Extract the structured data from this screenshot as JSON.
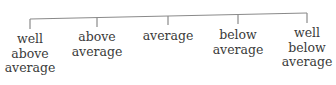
{
  "diagram": {
    "type": "rating-scale",
    "line_color": "#8a8a8a",
    "categories": [
      {
        "label": "well above average",
        "lines": [
          "well",
          "above",
          "average"
        ],
        "x": 30,
        "top": 24
      },
      {
        "label": "above average",
        "lines": [
          "above",
          "average"
        ],
        "x": 97,
        "top": 22
      },
      {
        "label": "average",
        "lines": [
          "average"
        ],
        "x": 168,
        "top": 22
      },
      {
        "label": "below average",
        "lines": [
          "below",
          "average"
        ],
        "x": 238,
        "top": 22
      },
      {
        "label": "well below average",
        "lines": [
          "well",
          "below",
          "average"
        ],
        "x": 307,
        "top": 20
      }
    ]
  }
}
